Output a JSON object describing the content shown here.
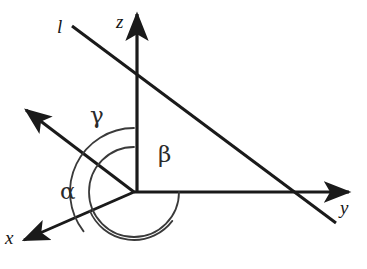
{
  "figure": {
    "kind": "geometry-diagram",
    "background_color": "#ffffff",
    "stroke_color": "#1a1a1a",
    "arc_color": "#3a3a3a",
    "width": 367,
    "height": 269
  },
  "axes": [
    {
      "id": "z-axis",
      "label": "z",
      "label_x": 116,
      "label_y": 12,
      "label_size": 19,
      "from_x": 137,
      "from_y": 192,
      "to_x": 137,
      "to_y": 14,
      "stroke_width": 3.2,
      "arrow": "end"
    },
    {
      "id": "y-axis",
      "label": "y",
      "label_x": 340,
      "label_y": 198,
      "label_size": 19,
      "from_x": 134,
      "from_y": 192,
      "to_x": 349,
      "to_y": 192,
      "stroke_width": 3.0,
      "arrow": "end"
    },
    {
      "id": "x-axis",
      "label": "x",
      "label_x": 5,
      "label_y": 228,
      "label_size": 19,
      "from_x": 134,
      "from_y": 192,
      "to_x": 24,
      "to_y": 240,
      "stroke_width": 3.0,
      "arrow": "end"
    }
  ],
  "lines": [
    {
      "id": "line-l",
      "label": "l",
      "label_x": 57,
      "label_y": 17,
      "label_size": 19,
      "from_x": 72,
      "from_y": 26,
      "to_x": 336,
      "to_y": 223,
      "stroke_width": 3.0,
      "arrow": "none"
    },
    {
      "id": "direction-ray",
      "label": "",
      "from_x": 134,
      "from_y": 192,
      "to_x": 26,
      "to_y": 110,
      "stroke_width": 3.0,
      "arrow": "end"
    }
  ],
  "angles": [
    {
      "id": "angle-gamma",
      "label": "γ",
      "label_x": 90,
      "label_y": 104,
      "label_size": 23,
      "radius": 64,
      "start_deg": 270,
      "end_deg": 142,
      "description": "angle between positive z-axis and the direction ray"
    },
    {
      "id": "angle-beta",
      "label": "β",
      "label_x": 158,
      "label_y": 143,
      "label_size": 23,
      "radius": 45,
      "start_deg": 270,
      "end_deg": 0,
      "description": "angle between positive z-axis and the positive y-axis"
    },
    {
      "id": "angle-alpha",
      "label": "α",
      "label_x": 60,
      "label_y": 180,
      "label_size": 23,
      "radius": 48,
      "start_deg": 157,
      "end_deg": 37,
      "description": "angle between positive x-axis and the direction ray"
    }
  ],
  "origin": {
    "x": 134,
    "y": 192
  }
}
